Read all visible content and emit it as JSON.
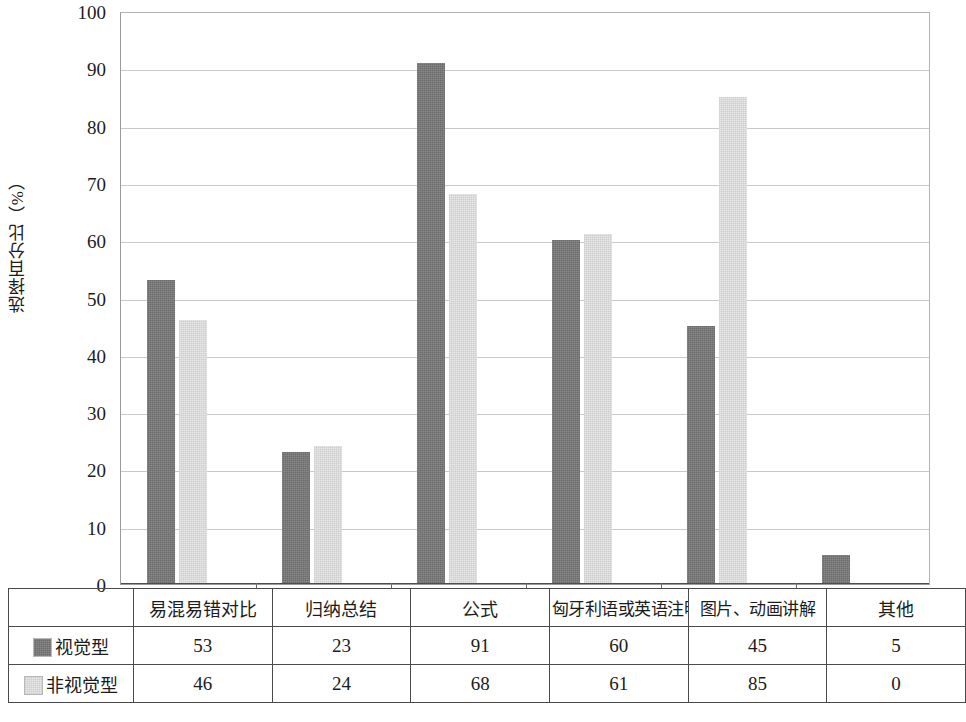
{
  "chart_data": {
    "type": "bar",
    "title": "",
    "xlabel": "",
    "ylabel": "选择百分比（%）",
    "ylim": [
      0,
      100
    ],
    "ytick_step": 10,
    "yticks": [
      100,
      90,
      80,
      70,
      60,
      50,
      40,
      30,
      20,
      10,
      0
    ],
    "grid": true,
    "legend_position": "data-table-left",
    "categories": [
      "易混易错对比",
      "归纳总结",
      "公式",
      "匈牙利语或英语注明",
      "图片、动画讲解",
      "其他"
    ],
    "series": [
      {
        "name": "视觉型",
        "color": "#6c6c6c",
        "values": [
          53,
          23,
          91,
          60,
          45,
          5
        ]
      },
      {
        "name": "非视觉型",
        "color": "#e7e7e7",
        "values": [
          46,
          24,
          68,
          61,
          85,
          0
        ]
      }
    ]
  },
  "table": {
    "corner_label": "",
    "column_headers": [
      "易混易错对比",
      "归纳总结",
      "公式",
      "匈牙利语或英语注明",
      "图片、动画讲解",
      "其他"
    ],
    "rows": [
      {
        "label": "视觉型",
        "swatch": "dark-gray-swatch",
        "cells": [
          "53",
          "23",
          "91",
          "60",
          "45",
          "5"
        ]
      },
      {
        "label": "非视觉型",
        "swatch": "light-gray-swatch",
        "cells": [
          "46",
          "24",
          "68",
          "61",
          "85",
          "0"
        ]
      }
    ]
  },
  "axis": {
    "y_title": "选择百分比（%）",
    "tick_100": "100",
    "tick_90": "90",
    "tick_80": "80",
    "tick_70": "70",
    "tick_60": "60",
    "tick_50": "50",
    "tick_40": "40",
    "tick_30": "30",
    "tick_20": "20",
    "tick_10": "10",
    "tick_0": "0"
  },
  "colors": {
    "series_visual": "#6c6c6c",
    "series_nonvisual": "#e7e7e7",
    "gridline": "#c9c9c9",
    "axis": "#4d4d4d",
    "table_border": "#4a4a4a",
    "background": "#ffffff"
  }
}
